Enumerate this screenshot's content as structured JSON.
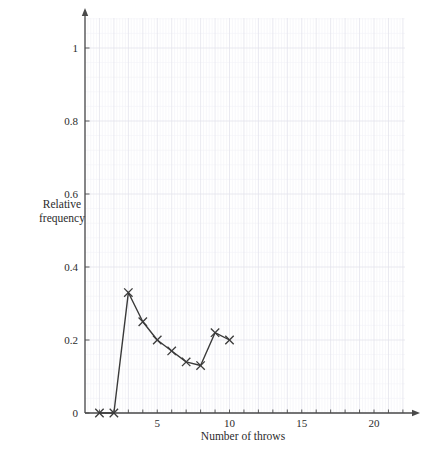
{
  "chart_data": {
    "type": "line",
    "title": "",
    "xlabel": "Number of throws",
    "ylabel": "Relative frequency",
    "ylabel_line1": "Relative",
    "ylabel_line2": "frequency",
    "x": [
      1,
      2,
      3,
      4,
      5,
      6,
      7,
      8,
      9,
      10
    ],
    "values": [
      0,
      0,
      0.33,
      0.25,
      0.2,
      0.17,
      0.14,
      0.13,
      0.22,
      0.2
    ],
    "series": [
      {
        "name": "Relative frequency",
        "values": [
          0,
          0,
          0.33,
          0.25,
          0.2,
          0.17,
          0.14,
          0.13,
          0.22,
          0.2
        ]
      }
    ],
    "xlim": [
      0,
      22
    ],
    "ylim": [
      0,
      1.1
    ],
    "xticks": [
      5,
      10,
      15,
      20
    ],
    "xtick_labels": [
      "5",
      "10",
      "15",
      "20"
    ],
    "yticks": [
      0,
      0.2,
      0.4,
      0.6,
      0.8,
      1
    ],
    "ytick_labels": [
      "0",
      "0.2",
      "0.4",
      "0.6",
      "0.8",
      "1"
    ],
    "grid": true,
    "grid_minor": true,
    "minor_per_major": 5,
    "legend": "none",
    "marker": "x",
    "line_color": "#3a3a3a",
    "marker_color": "#3a3a3a",
    "grid_major_color": "#e3e3ec",
    "grid_minor_color": "#f1f1f7",
    "axis_color": "#4a4a4a",
    "axis_arrows": true
  },
  "axes": {
    "y_tick_0": "0",
    "y_tick_1": "0.2",
    "y_tick_2": "0.4",
    "y_tick_3": "0.6",
    "y_tick_4": "0.8",
    "y_tick_5": "1",
    "x_tick_0": "5",
    "x_tick_1": "10",
    "x_tick_2": "15",
    "x_tick_3": "20"
  }
}
